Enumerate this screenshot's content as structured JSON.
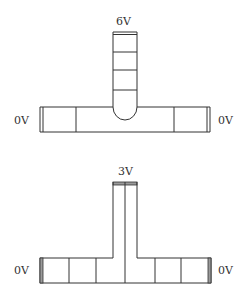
{
  "figures": [
    {
      "id": "top",
      "stem_label": "6V",
      "left_label": "0V",
      "right_label": "0V",
      "description": "T-shaped conductor with rounded stem bottom; stem divided into segments"
    },
    {
      "id": "bottom",
      "stem_label": "3V",
      "left_label": "0V",
      "right_label": "0V",
      "description": "T-shaped conductor with split stem; bar divided into segments"
    }
  ],
  "colors": {
    "line": "#333333",
    "electrode_fill": "#9a9a9a",
    "background": "#ffffff"
  }
}
